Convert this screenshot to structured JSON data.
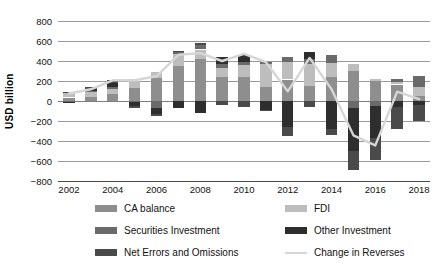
{
  "axis": {
    "ylabel": "USD billion",
    "yticks": [
      800,
      600,
      400,
      200,
      0,
      -200,
      -400,
      -600,
      -800
    ],
    "ytick_labels": [
      "800",
      "600",
      "400",
      "200",
      "0",
      "−200",
      "−400",
      "−600",
      "−800"
    ],
    "xtick_labels": [
      "2002",
      "2004",
      "2006",
      "2008",
      "2010",
      "2012",
      "2014",
      "2016",
      "2018"
    ]
  },
  "legend": {
    "items": [
      {
        "label": "CA balance",
        "key": "ca",
        "color": "#8e8e8e",
        "type": "swatch"
      },
      {
        "label": "FDI",
        "key": "fdi",
        "color": "#bdbdbd",
        "type": "swatch"
      },
      {
        "label": "Securities Investment",
        "key": "sec",
        "color": "#6a6a6a",
        "type": "swatch"
      },
      {
        "label": "Other Investment",
        "key": "oth",
        "color": "#2e2e2e",
        "type": "swatch"
      },
      {
        "label": "Net Errors and Omissions",
        "key": "neo",
        "color": "#4a4a4a",
        "type": "swatch"
      },
      {
        "label": "Change in Reverses",
        "key": "res",
        "color": "#d6d6d6",
        "type": "line"
      }
    ]
  },
  "chart_data": {
    "type": "bar",
    "title": "",
    "xlabel": "",
    "ylabel": "USD billion",
    "ylim": [
      -800,
      800
    ],
    "grid": true,
    "legend_position": "bottom",
    "stacked": true,
    "categories": [
      "2002",
      "2003",
      "2004",
      "2005",
      "2006",
      "2007",
      "2008",
      "2009",
      "2010",
      "2011",
      "2012",
      "2013",
      "2014",
      "2015",
      "2016",
      "2017",
      "2018"
    ],
    "series": [
      {
        "name": "CA balance",
        "color": "#8e8e8e",
        "values": [
          35,
          43,
          69,
          132,
          232,
          353,
          421,
          243,
          238,
          136,
          215,
          148,
          236,
          304,
          202,
          165,
          49
        ]
      },
      {
        "name": "FDI",
        "color": "#bdbdbd",
        "values": [
          47,
          47,
          53,
          68,
          60,
          121,
          94,
          87,
          124,
          232,
          176,
          218,
          145,
          68,
          16,
          27,
          92
        ]
      },
      {
        "name": "Securities Investment",
        "color": "#6a6a6a",
        "values": [
          -10,
          11,
          20,
          -5,
          -68,
          17,
          43,
          38,
          24,
          20,
          48,
          53,
          82,
          -66,
          -52,
          30,
          107
        ]
      },
      {
        "name": "Other Investment",
        "color": "#2e2e2e",
        "values": [
          -4,
          18,
          38,
          -47,
          -66,
          -71,
          -120,
          68,
          72,
          -89,
          -260,
          72,
          -278,
          -434,
          -316,
          -59,
          -36
        ]
      },
      {
        "name": "Net Errors and Omissions",
        "color": "#4a4a4a",
        "values": [
          8,
          18,
          27,
          -17,
          -13,
          13,
          19,
          -41,
          -60,
          -14,
          -87,
          -63,
          -67,
          -188,
          -223,
          -222,
          -160
        ]
      }
    ],
    "line_series": {
      "name": "Change in Reverses",
      "color": "#d6d6d6",
      "values": [
        75,
        117,
        207,
        207,
        247,
        462,
        479,
        400,
        472,
        388,
        97,
        431,
        118,
        -343,
        -444,
        93,
        19
      ]
    }
  }
}
